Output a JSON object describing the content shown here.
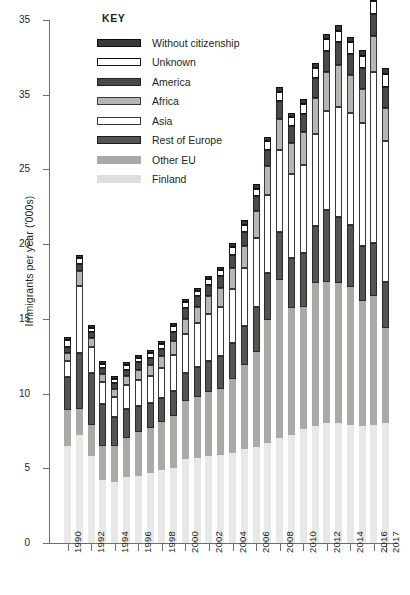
{
  "chart_data": {
    "type": "bar",
    "stacked": true,
    "title": "",
    "xlabel": "",
    "ylabel": "Immigrants per year ('000s)",
    "ylim": [
      0,
      35
    ],
    "yticks": [
      "0",
      "5",
      "10",
      "15",
      "20",
      "25",
      "35",
      "35"
    ],
    "ytick_values": [
      0,
      5,
      10,
      15,
      20,
      25,
      30,
      35
    ],
    "grid": false,
    "legend_position": "top-left",
    "legend_title": "KEY",
    "categories": [
      "1990",
      "1991",
      "1992",
      "1993",
      "1994",
      "1995",
      "1996",
      "1997",
      "1998",
      "1999",
      "2000",
      "2001",
      "2002",
      "2003",
      "2004",
      "2005",
      "2006",
      "2007",
      "2008",
      "2009",
      "2010",
      "2011",
      "2012",
      "2013",
      "2014",
      "2015",
      "2016",
      "2017"
    ],
    "xtick_labels": [
      "1990",
      "1992",
      "1994",
      "1996",
      "1998",
      "2000",
      "2002",
      "2004",
      "2006",
      "2008",
      "2010",
      "2012",
      "2014",
      "2016",
      "2017"
    ],
    "series": [
      {
        "name": "Finland",
        "color": "#e8e8e6",
        "values": [
          6.5,
          7.2,
          5.8,
          4.2,
          4.1,
          4.4,
          4.5,
          4.7,
          4.9,
          5.0,
          5.6,
          5.7,
          5.8,
          5.9,
          6.0,
          6.3,
          6.4,
          6.7,
          7.0,
          7.2,
          7.6,
          7.8,
          8.0,
          8.0,
          7.9,
          7.8,
          7.9,
          8.0
        ]
      },
      {
        "name": "Other EU",
        "color": "#a9a9a6",
        "values": [
          2.4,
          1.8,
          2.1,
          2.3,
          2.4,
          2.6,
          2.9,
          3.0,
          3.2,
          3.5,
          3.9,
          4.1,
          4.3,
          4.4,
          5.0,
          5.6,
          6.4,
          8.2,
          10.6,
          8.5,
          8.2,
          9.6,
          9.5,
          9.4,
          9.2,
          8.4,
          8.6,
          6.4
        ]
      },
      {
        "name": "Rest of Europe",
        "color": "#555452",
        "values": [
          2.2,
          3.7,
          3.5,
          2.8,
          1.9,
          2.0,
          1.8,
          1.7,
          1.6,
          1.7,
          1.9,
          2.0,
          2.1,
          2.2,
          2.4,
          2.6,
          3.0,
          3.2,
          3.2,
          3.4,
          3.6,
          3.8,
          4.8,
          4.4,
          4.2,
          3.7,
          3.6,
          3.1
        ]
      },
      {
        "name": "Asia",
        "color": "#ffffff",
        "values": [
          1.1,
          4.5,
          1.7,
          1.5,
          1.4,
          1.6,
          1.7,
          1.8,
          2.0,
          2.4,
          2.6,
          2.9,
          3.1,
          3.3,
          3.6,
          3.9,
          4.6,
          5.2,
          5.5,
          5.6,
          5.9,
          6.2,
          6.6,
          7.4,
          7.5,
          8.2,
          11.4,
          9.4
        ]
      },
      {
        "name": "Africa",
        "color": "#b6b6b3",
        "values": [
          0.5,
          1.0,
          0.6,
          0.5,
          0.5,
          0.6,
          0.7,
          0.7,
          0.8,
          0.9,
          1.0,
          1.1,
          1.2,
          1.3,
          1.4,
          1.5,
          1.8,
          1.9,
          2.1,
          2.1,
          2.2,
          2.4,
          2.6,
          2.8,
          2.5,
          2.3,
          2.4,
          2.2
        ]
      },
      {
        "name": "America",
        "color": "#4a4947",
        "values": [
          0.4,
          0.5,
          0.4,
          0.4,
          0.4,
          0.4,
          0.5,
          0.5,
          0.5,
          0.6,
          0.7,
          0.7,
          0.8,
          0.8,
          0.9,
          0.9,
          1.0,
          1.1,
          1.2,
          1.1,
          1.2,
          1.3,
          1.4,
          1.5,
          1.4,
          1.4,
          1.5,
          1.4
        ]
      },
      {
        "name": "Unknown",
        "color": "#ffffff",
        "values": [
          0.5,
          0.4,
          0.3,
          0.3,
          0.3,
          0.3,
          0.3,
          0.3,
          0.3,
          0.4,
          0.4,
          0.4,
          0.4,
          0.4,
          0.5,
          0.5,
          0.5,
          0.6,
          0.6,
          0.6,
          0.7,
          0.7,
          0.8,
          0.8,
          0.8,
          0.8,
          0.9,
          0.9
        ]
      },
      {
        "name": "Without citizenship",
        "color": "#3a3938",
        "values": [
          0.2,
          0.2,
          0.2,
          0.2,
          0.2,
          0.2,
          0.2,
          0.2,
          0.2,
          0.2,
          0.2,
          0.2,
          0.2,
          0.2,
          0.3,
          0.3,
          0.3,
          0.3,
          0.3,
          0.3,
          0.3,
          0.3,
          0.4,
          0.4,
          0.4,
          0.4,
          0.4,
          0.4
        ]
      }
    ]
  }
}
